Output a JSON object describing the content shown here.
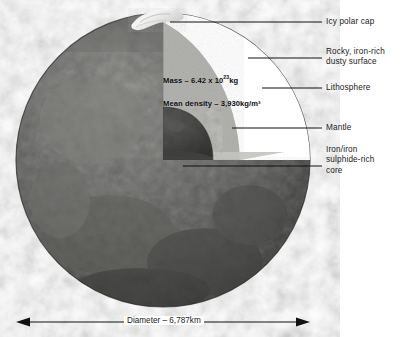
{
  "figure": {
    "colors": {
      "surface_dark": "#585858",
      "surface_mid": "#6f6f6f",
      "surface_light": "#8f8f8f",
      "lithosphere": "#d8d8d4",
      "mantle": "#a9a9a5",
      "mantle_floor": "#bdbdb9",
      "core": "#4a4a48",
      "polar_cap": "#f2f2f0",
      "line": "#111111",
      "background": "#ffffff"
    }
  },
  "callouts": [
    {
      "id": "icy-polar-cap",
      "label": "Icy polar cap"
    },
    {
      "id": "rocky-surface",
      "label": "Rocky, iron-rich\ndusty surface"
    },
    {
      "id": "lithosphere",
      "label": "Lithosphere"
    },
    {
      "id": "mantle",
      "label": "Mantle"
    },
    {
      "id": "core",
      "label": "Iron/iron\nsulphide-rich\ncore"
    }
  ],
  "inner_annotations": {
    "mass_prefix": "Mass – 6.42 x 10",
    "mass_exponent": "23",
    "mass_suffix": "kg",
    "mean_density": "Mean density – 3,930kg/m³"
  },
  "dimension": {
    "label": "Diameter – 6,787km"
  }
}
